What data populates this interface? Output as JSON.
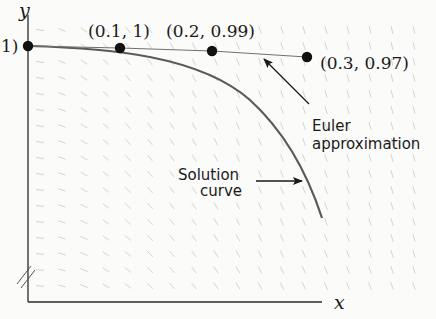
{
  "figure": {
    "axis_x_label": "x",
    "axis_y_label": "y",
    "y_intercept_label": "1)",
    "points": [
      {
        "label": "",
        "x": 0.0,
        "y": 1.0
      },
      {
        "label": "(0.1, 1)",
        "x": 0.1,
        "y": 1.0
      },
      {
        "label": "(0.2, 0.99)",
        "x": 0.2,
        "y": 0.99
      },
      {
        "label": "(0.3, 0.97)",
        "x": 0.3,
        "y": 0.97
      }
    ],
    "annotations": {
      "euler_line1": "Euler",
      "euler_line2": "approximation",
      "solution_line1": "Solution",
      "solution_line2": "curve"
    },
    "colors": {
      "axis": "#2a2a2a",
      "curve": "#555555",
      "euler_line": "#666666",
      "points": "#111111",
      "field": "#cfcfcf"
    }
  }
}
